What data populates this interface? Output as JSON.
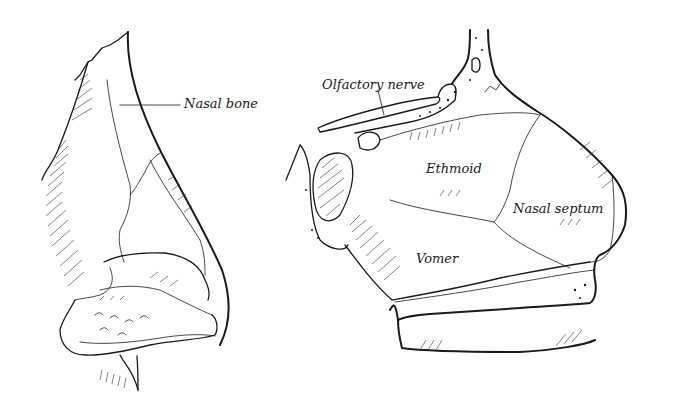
{
  "figure": {
    "panels": [
      {
        "id": "external-nose",
        "labels": [
          {
            "text": "Nasal bone",
            "x": 184,
            "y": 97
          }
        ]
      },
      {
        "id": "nasal-septum-lateral",
        "labels": [
          {
            "text": "Olfactory nerve",
            "x": 322,
            "y": 85
          },
          {
            "text": "Ethmoid",
            "x": 426,
            "y": 169
          },
          {
            "text": "Nasal septum",
            "x": 513,
            "y": 208
          },
          {
            "text": "Vomer",
            "x": 416,
            "y": 258
          }
        ]
      }
    ],
    "colors": {
      "background": "#ffffff",
      "ink": "#1a1a1a"
    }
  }
}
